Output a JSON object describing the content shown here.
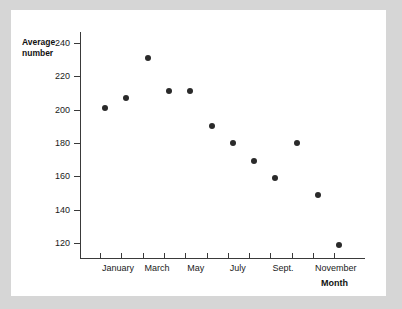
{
  "chart_data": {
    "type": "scatter",
    "title": "",
    "xlabel": "Month",
    "ylabel": "Average number",
    "ylabel_lines": [
      "Average",
      "number"
    ],
    "categories": [
      "January",
      "February",
      "March",
      "April",
      "May",
      "June",
      "July",
      "August",
      "September",
      "October",
      "November",
      "December"
    ],
    "values": [
      201,
      207,
      231,
      211,
      211,
      190,
      180,
      169,
      159,
      180,
      149,
      119
    ],
    "x_tick_labels": [
      "January",
      "",
      "March",
      "",
      "May",
      "",
      "July",
      "",
      "Sept.",
      "",
      "November",
      ""
    ],
    "y_ticks": [
      240,
      220,
      200,
      180,
      160,
      140,
      120
    ],
    "ylim": [
      110,
      248
    ],
    "grid": false,
    "legend": false,
    "marker_color": "#2a2a2a",
    "axis_color": "#3a3a3a"
  },
  "canvas": {
    "background_color": "#d6d6d6",
    "card_color": "#ffffff"
  }
}
